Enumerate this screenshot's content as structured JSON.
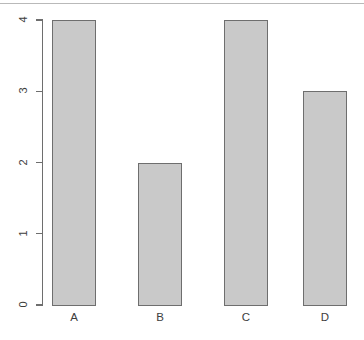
{
  "chart_data": {
    "type": "bar",
    "title": "",
    "subtitle": "",
    "xlabel": "",
    "ylabel": "",
    "categories": [
      "A",
      "B",
      "C",
      "D"
    ],
    "values": [
      4,
      2,
      4,
      3
    ],
    "series": [
      {
        "name": "",
        "values": [
          4,
          2,
          4,
          3
        ]
      }
    ],
    "ylim": [
      0,
      4
    ],
    "y_ticks": [
      0,
      1,
      2,
      3,
      4
    ],
    "y_tick_labels": [
      "0",
      "1",
      "2",
      "3",
      "4"
    ],
    "x_tick_labels": [
      "A",
      "B",
      "C",
      "D"
    ],
    "grid": false,
    "legend": false,
    "legend_position": "none",
    "annotations": [],
    "style": {
      "bar_fill": "#c9c9c9",
      "bar_border": "#6e6e6e",
      "axis_color": "#6e6e6e",
      "text_color": "#3d3d3d",
      "background": "#ffffff",
      "y_tick_label_rotation": "vertical"
    }
  }
}
